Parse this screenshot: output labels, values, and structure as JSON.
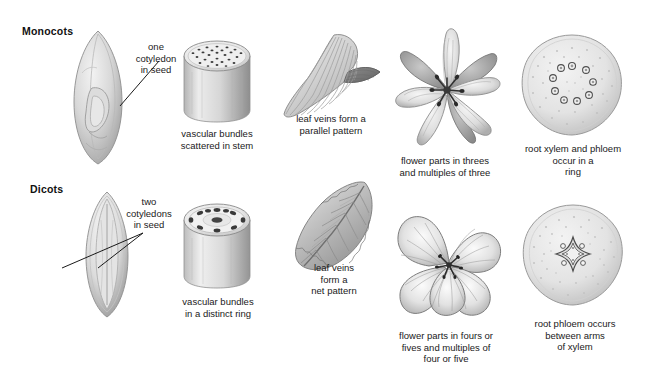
{
  "diagram": {
    "title_rows": [
      {
        "id": "monocots",
        "label": "Monocots"
      },
      {
        "id": "dicots",
        "label": "Dicots"
      }
    ],
    "palette": {
      "background": "#ffffff",
      "text": "#1a1a1a",
      "heading": "#111111",
      "line": "#1a1a1a",
      "illustration_light": "#e6e6e6",
      "illustration_mid": "#c2c2c2",
      "illustration_dark": "#8f8f8f",
      "illustration_darkest": "#5c5c5c"
    },
    "monocot": {
      "seed": {
        "label": "one\ncotyledon\nin seed",
        "icon": "monocot-seed-illustration"
      },
      "stem": {
        "label": "vascular bundles\nscattered in stem",
        "icon": "monocot-stem-cross-section-illustration",
        "bundle_count": 26
      },
      "leaf": {
        "label": "leaf veins form a\nparallel pattern",
        "icon": "monocot-leaf-illustration",
        "vein_count": 11
      },
      "flower": {
        "label": "flower parts in threes\nand multiples of three",
        "icon": "monocot-flower-trillium-illustration",
        "petal_count": 3,
        "sepal_count": 3
      },
      "root": {
        "label": "root xylem and phloem\noccur in a\nring",
        "icon": "monocot-root-cross-section-illustration",
        "ring_bundle_count": 9
      }
    },
    "dicot": {
      "seed": {
        "label": "two\ncotyledons\nin seed",
        "icon": "dicot-seed-illustration"
      },
      "stem": {
        "label": "vascular bundles\nin a distinct ring",
        "icon": "dicot-stem-cross-section-illustration",
        "bundle_count": 9
      },
      "leaf": {
        "label": "leaf veins\nform a\nnet pattern",
        "icon": "dicot-leaf-illustration"
      },
      "flower": {
        "label": "flower parts in fours or\nfives and multiples of\nfour or five",
        "icon": "dicot-flower-illustration",
        "petal_count": 5
      },
      "root": {
        "label": "root phloem occurs\nbetween arms\nof xylem",
        "icon": "dicot-root-cross-section-illustration",
        "xylem_arms": 4
      }
    }
  }
}
